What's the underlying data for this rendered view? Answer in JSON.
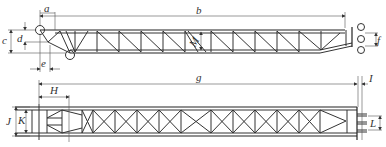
{
  "diagram": {
    "type": "technical-drawing",
    "colors": {
      "line": "#333333",
      "background": "#ffffff"
    },
    "side_view": {
      "dimension_labels": {
        "a": "a",
        "b": "b",
        "c": "c",
        "d": "d",
        "e": "e",
        "M": "M",
        "f": "f"
      }
    },
    "plan_view": {
      "dimension_labels": {
        "g": "g",
        "H": "H",
        "I": "I",
        "J": "J",
        "K": "K",
        "L": "L"
      }
    }
  }
}
